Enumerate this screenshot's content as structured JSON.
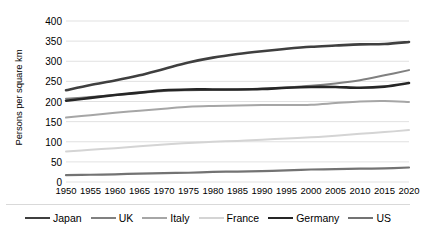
{
  "chart_data": {
    "type": "line",
    "title": "",
    "xlabel": "",
    "ylabel": "Persons per square km",
    "xlim": [
      1950,
      2020
    ],
    "ylim": [
      0,
      400
    ],
    "grid": true,
    "legend_position": "bottom",
    "categories": [
      1950,
      1955,
      1960,
      1965,
      1970,
      1975,
      1980,
      1985,
      1990,
      1995,
      2000,
      2005,
      2010,
      2015,
      2020
    ],
    "series": [
      {
        "name": "Japan",
        "color": "#3f3f3f",
        "width": 2.6,
        "values": [
          228,
          241,
          252,
          265,
          281,
          297,
          309,
          318,
          325,
          331,
          336,
          339,
          342,
          343,
          348
        ]
      },
      {
        "name": "UK",
        "color": "#808080",
        "width": 2.0,
        "values": [
          207,
          211,
          216,
          221,
          226,
          228,
          229,
          230,
          232,
          235,
          239,
          245,
          253,
          265,
          278
        ]
      },
      {
        "name": "Italy",
        "color": "#a6a6a6",
        "width": 2.0,
        "values": [
          160,
          166,
          172,
          177,
          182,
          187,
          189,
          190,
          191,
          191,
          192,
          196,
          200,
          201,
          199
        ]
      },
      {
        "name": "France",
        "color": "#d4d4d4",
        "width": 2.0,
        "values": [
          76,
          80,
          84,
          89,
          93,
          97,
          100,
          102,
          105,
          108,
          111,
          115,
          120,
          124,
          129
        ]
      },
      {
        "name": "Germany",
        "color": "#262626",
        "width": 2.6,
        "values": [
          202,
          209,
          216,
          222,
          228,
          230,
          230,
          230,
          231,
          234,
          236,
          236,
          234,
          237,
          246
        ]
      },
      {
        "name": "US",
        "color": "#737373",
        "width": 2.2,
        "values": [
          17,
          18,
          19,
          21,
          22,
          23,
          25,
          26,
          27,
          29,
          31,
          32,
          33,
          34,
          36
        ]
      }
    ],
    "y_ticks": [
      0,
      50,
      100,
      150,
      200,
      250,
      300,
      350,
      400
    ],
    "x_ticks": [
      "1950",
      "1955",
      "1960",
      "1965",
      "1970",
      "1975",
      "1980",
      "1985",
      "1990",
      "1995",
      "2000",
      "2005",
      "2010",
      "2015",
      "2020"
    ],
    "gridline_color": "#d9d9d9"
  }
}
